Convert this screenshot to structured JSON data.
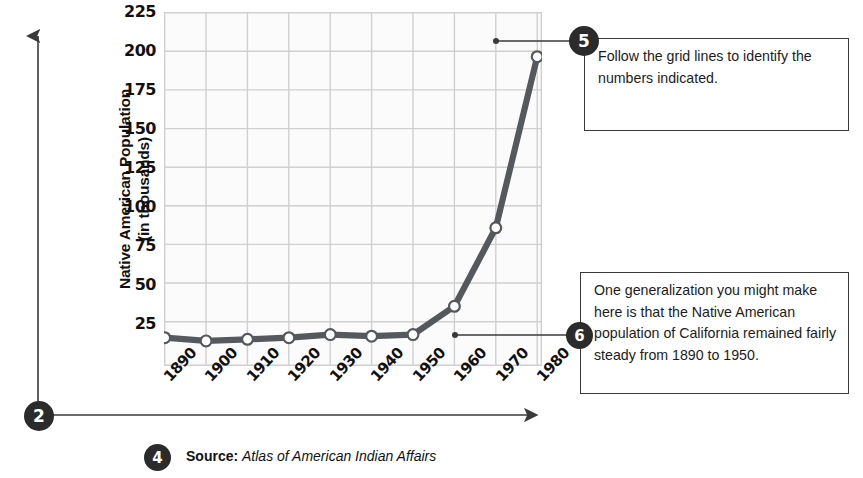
{
  "chart_data": {
    "type": "line",
    "title": "",
    "xlabel": "",
    "ylabel": "Native American Population (in thousands)",
    "categories": [
      "1890",
      "1900",
      "1910",
      "1920",
      "1930",
      "1940",
      "1950",
      "1960",
      "1970",
      "1980"
    ],
    "values": [
      18,
      16,
      17,
      18,
      20,
      19,
      20,
      38,
      88,
      197
    ],
    "series": [
      {
        "name": "Native American Population of California (in thousands)",
        "values": [
          18,
          16,
          17,
          18,
          20,
          19,
          20,
          38,
          88,
          197
        ]
      }
    ],
    "ylim": [
      0,
      225
    ],
    "yticks": [
      25,
      50,
      75,
      100,
      125,
      150,
      175,
      200,
      225
    ],
    "grid": true,
    "legend": false,
    "line_color": "#55585c",
    "marker_fill": "#ffffff",
    "marker_stroke": "#55585c"
  },
  "axis": {
    "y_title_line1": "Native American Population",
    "y_title_line2": "(in thousands)",
    "y_tick_labels": [
      "225",
      "200",
      "175",
      "150",
      "125",
      "100",
      "75",
      "50",
      "25"
    ],
    "x_tick_labels": [
      "1890",
      "1900",
      "1910",
      "1920",
      "1930",
      "1940",
      "1950",
      "1960",
      "1970",
      "1980"
    ]
  },
  "markers": {
    "origin": "2",
    "source": "4",
    "gridlines_note": "5",
    "generalization_note": "6"
  },
  "callouts": {
    "gridlines": {
      "number": "5",
      "text": "Follow the grid lines to identify the numbers indicated."
    },
    "generalization": {
      "number": "6",
      "text": "One generalization you might make here is that the Native American population of California remained fairly steady from 1890 to 1950."
    }
  },
  "source": {
    "label": "Source:",
    "title": "Atlas of American Indian Affairs"
  },
  "colors": {
    "line": "#55585c",
    "marker_ink": "#2b2b2b",
    "grid": "#d4d4d4",
    "plot_bg": "#fcfcfc",
    "text": "#1c1c1c"
  }
}
